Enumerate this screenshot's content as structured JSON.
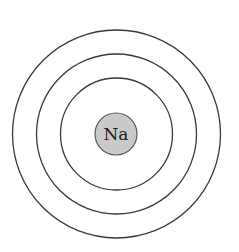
{
  "diagram": {
    "type": "bohr-model",
    "element_symbol": "Na",
    "shell_count": 3,
    "colors": {
      "ring": "#3a3a3a",
      "nucleus_fill": "#c9c9c9",
      "nucleus_stroke": "#555555",
      "background": "#ffffff"
    }
  }
}
